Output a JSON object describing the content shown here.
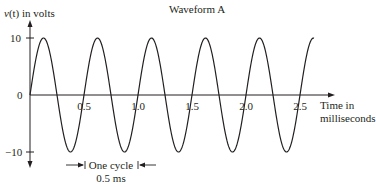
{
  "chart_data": {
    "type": "line",
    "title": "Waveform A",
    "ylabel": "v(t) in volts",
    "xlabel": "Time in milliseconds",
    "xlabel_lines": [
      "Time in",
      "milliseconds"
    ],
    "x_ticks": [
      "0.5",
      "1.0",
      "1.5",
      "2.0",
      "2.5"
    ],
    "x_tick_values": [
      0.5,
      1.0,
      1.5,
      2.0,
      2.5
    ],
    "y_ticks": [
      "10",
      "0",
      "−10"
    ],
    "y_tick_values": [
      10,
      0,
      -10
    ],
    "xlim": [
      0,
      2.6
    ],
    "ylim": [
      -10,
      10
    ],
    "grid": false,
    "series": [
      {
        "name": "v(t) = 10 sin(2π·2000·t)",
        "amplitude": 10,
        "period_ms": 0.5,
        "frequency_hz": 2000,
        "x": [
          0,
          0.125,
          0.25,
          0.375,
          0.5,
          0.625,
          0.75,
          0.875,
          1.0,
          1.125,
          1.25,
          1.375,
          1.5,
          1.625,
          1.75,
          1.875,
          2.0,
          2.125,
          2.25,
          2.375,
          2.5,
          2.625
        ],
        "values": [
          0,
          10,
          0,
          -10,
          0,
          10,
          0,
          -10,
          0,
          10,
          0,
          -10,
          0,
          10,
          0,
          -10,
          0,
          10,
          0,
          -10,
          0,
          10
        ]
      }
    ],
    "annotations": [
      {
        "text": "One cycle",
        "subtext": "0.5 ms",
        "type": "dimension-arrow"
      }
    ]
  },
  "labels": {
    "title": "Waveform A",
    "ylabel_v": "v",
    "ylabel_t": "(t)",
    "ylabel_rest": " in volts",
    "y10": "10",
    "y0": "0",
    "yneg10": "−10",
    "xt1": "0.5",
    "xt2": "1.0",
    "xt3": "1.5",
    "xt4": "2.0",
    "xt5": "2.5",
    "xlabel1": "Time in",
    "xlabel2": "milliseconds",
    "cycle": "One cycle",
    "cycle_dur": "0.5 ms"
  },
  "colors": {
    "ink": "#231f20",
    "background": "#ffffff"
  }
}
